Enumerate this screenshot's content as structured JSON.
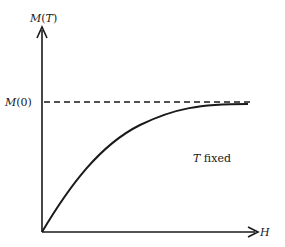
{
  "diagram": {
    "y_axis_label": {
      "func": "M",
      "open": "(",
      "var": "T",
      "close": ")"
    },
    "x_axis_label": "H",
    "asymptote_label": {
      "func": "M",
      "arg": "(0)"
    },
    "annotation": {
      "var": "T",
      "rest": " fixed"
    },
    "colors": {
      "stroke": "#1a1a1a",
      "background": "#ffffff"
    }
  }
}
